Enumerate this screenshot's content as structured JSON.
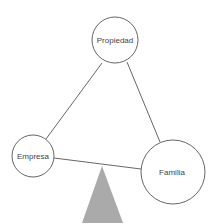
{
  "diagram": {
    "type": "three-circle balance diagram",
    "nodes": [
      {
        "id": "propiedad",
        "label": "Propiedad",
        "cx": 115,
        "cy": 40,
        "r": 23
      },
      {
        "id": "empresa",
        "label": "Empresa",
        "cx": 33,
        "cy": 156,
        "r": 21
      },
      {
        "id": "familia",
        "label": "Familia",
        "cx": 173,
        "cy": 172,
        "r": 32
      }
    ],
    "edges": [
      {
        "from": "propiedad",
        "to": "empresa"
      },
      {
        "from": "propiedad",
        "to": "familia"
      },
      {
        "from": "empresa",
        "to": "familia"
      }
    ],
    "fulcrum": {
      "shape": "triangle",
      "color": "#aaaaaa"
    }
  }
}
